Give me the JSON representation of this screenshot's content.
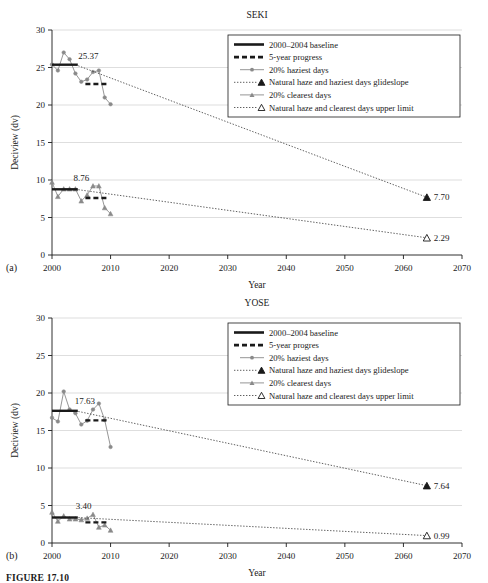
{
  "figure": {
    "caption": "FIGURE 17.10",
    "panel_a_tag": "(a)",
    "panel_b_tag": "(b)"
  },
  "chart_data": [
    {
      "type": "line",
      "panel": "(a)",
      "title": "SEKI",
      "xlabel": "Year",
      "ylabel": "Deciview (dv)",
      "xlim": [
        2000,
        2070
      ],
      "ylim": [
        0,
        30
      ],
      "xticks": [
        2000,
        2010,
        2020,
        2030,
        2040,
        2050,
        2060,
        2070
      ],
      "yticks": [
        0,
        5,
        10,
        15,
        20,
        25,
        30
      ],
      "grid": "horizontal",
      "legend_position": "top-right",
      "legend": [
        {
          "label": "2000–2004 baseline",
          "marker": "solid-thick-line"
        },
        {
          "label": "5-year progress",
          "marker": "dashed-thick-line"
        },
        {
          "label": "20% haziest days",
          "marker": "line-circle"
        },
        {
          "label": "Natural haze and haziest days glideslope",
          "marker": "dotted-filled-triangle"
        },
        {
          "label": "20% clearest days",
          "marker": "line-triangle"
        },
        {
          "label": "Natural haze and clearest days upper limit",
          "marker": "dotted-open-triangle"
        }
      ],
      "annotations": [
        {
          "text": "25.37",
          "x": 2006.2,
          "y": 26.1
        },
        {
          "text": "8.76",
          "x": 2005.0,
          "y": 9.9
        },
        {
          "text": "7.70",
          "x": 2065.0,
          "y": 7.7
        },
        {
          "text": "2.29",
          "x": 2065.0,
          "y": 2.29
        }
      ],
      "series": [
        {
          "name": "20% haziest days",
          "marker": "circle",
          "x": [
            2000,
            2001,
            2002,
            2003,
            2004,
            2005,
            2006,
            2007,
            2008,
            2009,
            2010
          ],
          "values": [
            25.4,
            24.6,
            27.0,
            26.1,
            24.2,
            23.1,
            23.4,
            24.4,
            24.6,
            21.0,
            20.1
          ]
        },
        {
          "name": "20% clearest days",
          "marker": "triangle",
          "x": [
            2000,
            2001,
            2002,
            2003,
            2004,
            2005,
            2006,
            2007,
            2008,
            2009,
            2010
          ],
          "values": [
            9.7,
            7.8,
            8.8,
            8.8,
            8.8,
            7.2,
            8.0,
            9.2,
            9.2,
            6.3,
            5.5
          ]
        },
        {
          "name": "2000–2004 baseline (haziest)",
          "marker": "solid-thick-line",
          "x": [
            2000,
            2004.4
          ],
          "values": [
            25.37,
            25.37
          ]
        },
        {
          "name": "5-year progress (haziest)",
          "marker": "dashed-thick-line",
          "x": [
            2005.7,
            2009.4
          ],
          "values": [
            22.8,
            22.8
          ]
        },
        {
          "name": "2000–2004 baseline (clearest)",
          "marker": "solid-thick-line",
          "x": [
            2000,
            2004.4
          ],
          "values": [
            8.76,
            8.76
          ]
        },
        {
          "name": "5-year progress (clearest)",
          "marker": "dashed-thick-line",
          "x": [
            2005.7,
            2009.4
          ],
          "values": [
            7.6,
            7.6
          ]
        },
        {
          "name": "Natural haze and haziest days glideslope",
          "marker": "dotted-filled-triangle",
          "x": [
            2004,
            2064
          ],
          "values": [
            25.37,
            7.7
          ]
        },
        {
          "name": "Natural haze and clearest days upper limit",
          "marker": "dotted-open-triangle",
          "x": [
            2004,
            2064
          ],
          "values": [
            8.76,
            2.29
          ]
        }
      ]
    },
    {
      "type": "line",
      "panel": "(b)",
      "title": "YOSE",
      "xlabel": "Year",
      "ylabel": "Deciview (dv)",
      "xlim": [
        2000,
        2070
      ],
      "ylim": [
        0,
        30
      ],
      "xticks": [
        2000,
        2010,
        2020,
        2030,
        2040,
        2050,
        2060,
        2070
      ],
      "yticks": [
        0,
        5,
        10,
        15,
        20,
        25,
        30
      ],
      "grid": "horizontal",
      "legend_position": "top-right",
      "legend": [
        {
          "label": "2000–2004 baseline",
          "marker": "solid-thick-line"
        },
        {
          "label": "5-year progres",
          "marker": "dashed-thick-line"
        },
        {
          "label": "20% haziest days",
          "marker": "line-circle"
        },
        {
          "label": "Natural haze and haziest days glideslope",
          "marker": "dotted-filled-triangle"
        },
        {
          "label": "20% clearest days",
          "marker": "line-triangle"
        },
        {
          "label": "Natural haze and clearest days upper limit",
          "marker": "dotted-open-triangle"
        }
      ],
      "annotations": [
        {
          "text": "17.63",
          "x": 2005.6,
          "y": 18.6
        },
        {
          "text": "3.40",
          "x": 2005.4,
          "y": 4.5
        },
        {
          "text": "7.64",
          "x": 2065.0,
          "y": 7.64
        },
        {
          "text": "0.99",
          "x": 2065.0,
          "y": 0.99
        }
      ],
      "series": [
        {
          "name": "20% haziest days",
          "marker": "circle",
          "x": [
            2000,
            2001,
            2002,
            2003,
            2004,
            2005,
            2006,
            2007,
            2008,
            2009,
            2010
          ],
          "values": [
            16.7,
            16.2,
            20.2,
            17.8,
            17.3,
            15.8,
            16.3,
            17.8,
            18.6,
            16.4,
            12.8
          ]
        },
        {
          "name": "20% clearest days",
          "marker": "triangle",
          "x": [
            2000,
            2001,
            2002,
            2003,
            2004,
            2005,
            2006,
            2007,
            2008,
            2009,
            2010
          ],
          "values": [
            4.1,
            2.9,
            3.6,
            3.2,
            3.2,
            3.1,
            3.3,
            3.8,
            2.1,
            2.4,
            1.7
          ]
        },
        {
          "name": "2000–2004 baseline (haziest)",
          "marker": "solid-thick-line",
          "x": [
            2000,
            2004.4
          ],
          "values": [
            17.63,
            17.63
          ]
        },
        {
          "name": "5-year progress (haziest)",
          "marker": "dashed-thick-line",
          "x": [
            2005.7,
            2009.4
          ],
          "values": [
            16.35,
            16.35
          ]
        },
        {
          "name": "2000–2004 baseline (clearest)",
          "marker": "solid-thick-line",
          "x": [
            2000,
            2004.4
          ],
          "values": [
            3.4,
            3.4
          ]
        },
        {
          "name": "5-year progress (clearest)",
          "marker": "dashed-thick-line",
          "x": [
            2005.7,
            2009.4
          ],
          "values": [
            2.75,
            2.75
          ]
        },
        {
          "name": "Natural haze and haziest days glideslope",
          "marker": "dotted-filled-triangle",
          "x": [
            2004,
            2064
          ],
          "values": [
            17.63,
            7.64
          ]
        },
        {
          "name": "Natural haze and clearest days upper limit",
          "marker": "dotted-open-triangle",
          "x": [
            2004,
            2064
          ],
          "values": [
            3.4,
            0.99
          ]
        }
      ]
    }
  ]
}
